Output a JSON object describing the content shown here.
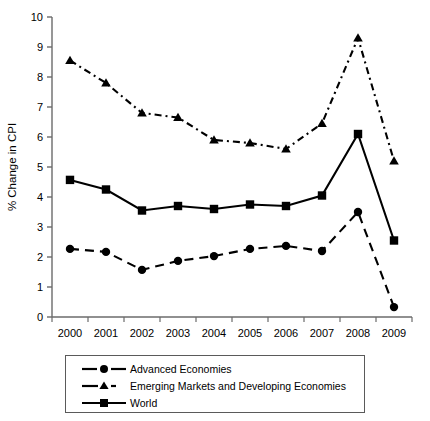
{
  "chart_data": {
    "type": "line",
    "title": "",
    "xlabel": "",
    "ylabel": "% Change in CPI",
    "x": [
      2000,
      2001,
      2002,
      2003,
      2004,
      2005,
      2006,
      2007,
      2008,
      2009
    ],
    "categories": [
      "2000",
      "2001",
      "2002",
      "2003",
      "2004",
      "2005",
      "2006",
      "2007",
      "2008",
      "2009"
    ],
    "ylim": [
      0,
      10
    ],
    "yticks": [
      0,
      1,
      2,
      3,
      4,
      5,
      6,
      7,
      8,
      9,
      10
    ],
    "ytick_labels": [
      "0",
      "1",
      "2",
      "3",
      "4",
      "5",
      "6",
      "7",
      "8",
      "9",
      "10"
    ],
    "grid": false,
    "legend_position": "bottom",
    "series": [
      {
        "name": "Advanced Economies",
        "marker": "circle",
        "line_style": "dashed",
        "color": "#000000",
        "values": [
          2.27,
          2.17,
          1.57,
          1.87,
          2.03,
          2.27,
          2.37,
          2.2,
          3.5,
          0.33
        ]
      },
      {
        "name": "Emerging Markets and Developing Economies",
        "marker": "triangle",
        "line_style": "dash-dot",
        "color": "#000000",
        "values": [
          8.55,
          7.8,
          6.8,
          6.65,
          5.9,
          5.8,
          5.6,
          6.45,
          9.3,
          5.2
        ]
      },
      {
        "name": "World",
        "marker": "square",
        "line_style": "solid",
        "color": "#000000",
        "values": [
          4.57,
          4.25,
          3.55,
          3.7,
          3.6,
          3.75,
          3.7,
          4.05,
          6.1,
          2.55
        ]
      }
    ]
  },
  "axes": {
    "y_axis_title": "% Change in CPI"
  },
  "legend": {
    "items": [
      {
        "label": "Advanced Economies",
        "marker": "circle",
        "line_style": "dashed"
      },
      {
        "label": "Emerging Markets and Developing Economies",
        "marker": "triangle",
        "line_style": "dash-dot"
      },
      {
        "label": "World",
        "marker": "square",
        "line_style": "solid"
      }
    ]
  },
  "colors": {
    "ink": "#000000",
    "axis": "#6b6b6b",
    "legend_border": "#5a5a5a",
    "background": "#ffffff"
  }
}
